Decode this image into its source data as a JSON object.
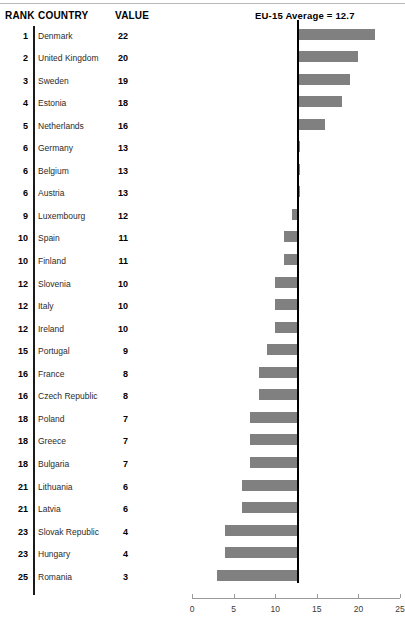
{
  "header": {
    "rank_label": "RANK",
    "country_label": "COUNTRY",
    "value_label": "VALUE",
    "average_label": "EU-15 Average = 12.7"
  },
  "rows": [
    {
      "rank": "1",
      "country": "Denmark",
      "value": "22"
    },
    {
      "rank": "2",
      "country": "United Kingdom",
      "value": "20"
    },
    {
      "rank": "3",
      "country": "Sweden",
      "value": "19"
    },
    {
      "rank": "4",
      "country": "Estonia",
      "value": "18"
    },
    {
      "rank": "5",
      "country": "Netherlands",
      "value": "16"
    },
    {
      "rank": "6",
      "country": "Germany",
      "value": "13"
    },
    {
      "rank": "6",
      "country": "Belgium",
      "value": "13"
    },
    {
      "rank": "6",
      "country": "Austria",
      "value": "13"
    },
    {
      "rank": "9",
      "country": "Luxembourg",
      "value": "12"
    },
    {
      "rank": "10",
      "country": "Spain",
      "value": "11"
    },
    {
      "rank": "10",
      "country": "Finland",
      "value": "11"
    },
    {
      "rank": "12",
      "country": "Slovenia",
      "value": "10"
    },
    {
      "rank": "12",
      "country": "Italy",
      "value": "10"
    },
    {
      "rank": "12",
      "country": "Ireland",
      "value": "10"
    },
    {
      "rank": "15",
      "country": "Portugal",
      "value": "9"
    },
    {
      "rank": "16",
      "country": "France",
      "value": "8"
    },
    {
      "rank": "16",
      "country": "Czech Republic",
      "value": "8"
    },
    {
      "rank": "18",
      "country": "Poland",
      "value": "7"
    },
    {
      "rank": "18",
      "country": "Greece",
      "value": "7"
    },
    {
      "rank": "18",
      "country": "Bulgaria",
      "value": "7"
    },
    {
      "rank": "21",
      "country": "Lithuania",
      "value": "6"
    },
    {
      "rank": "21",
      "country": "Latvia",
      "value": "6"
    },
    {
      "rank": "23",
      "country": "Slovak Republic",
      "value": "4"
    },
    {
      "rank": "23",
      "country": "Hungary",
      "value": "4"
    },
    {
      "rank": "25",
      "country": "Romania",
      "value": "3"
    }
  ],
  "chart_data": {
    "type": "bar",
    "orientation": "horizontal",
    "title": "",
    "annotation": "EU-15 Average = 12.7",
    "reference_value": 12.7,
    "baseline": "reference_value",
    "categories": [
      "Denmark",
      "United Kingdom",
      "Sweden",
      "Estonia",
      "Netherlands",
      "Germany",
      "Belgium",
      "Austria",
      "Luxembourg",
      "Spain",
      "Finland",
      "Slovenia",
      "Italy",
      "Ireland",
      "Portugal",
      "France",
      "Czech Republic",
      "Poland",
      "Greece",
      "Bulgaria",
      "Lithuania",
      "Latvia",
      "Slovak Republic",
      "Hungary",
      "Romania"
    ],
    "values": [
      22,
      20,
      19,
      18,
      16,
      13,
      13,
      13,
      12,
      11,
      11,
      10,
      10,
      10,
      9,
      8,
      8,
      7,
      7,
      7,
      6,
      6,
      4,
      4,
      3
    ],
    "ranks": [
      1,
      2,
      3,
      4,
      5,
      6,
      6,
      6,
      9,
      10,
      10,
      12,
      12,
      12,
      15,
      16,
      16,
      18,
      18,
      18,
      21,
      21,
      23,
      23,
      25
    ],
    "xlabel": "",
    "ylabel": "",
    "xlim": [
      0,
      25
    ],
    "xticks": [
      0,
      5,
      10,
      15,
      20,
      25
    ],
    "xtick_labels": [
      "0",
      "5",
      "10",
      "15",
      "20",
      "25"
    ],
    "grid": false,
    "legend": false,
    "bar_color": "#808080",
    "reference_line_color": "#000000"
  }
}
